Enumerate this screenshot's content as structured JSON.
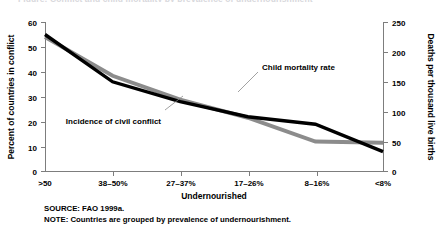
{
  "figure": {
    "cut_title": "Figure: Conflict and child mortality by prevalence of undernourishment",
    "background": "#ffffff"
  },
  "chart_data": {
    "type": "line",
    "title": "",
    "xlabel": "Undernourished",
    "categories": [
      ">50",
      "38–50%",
      "27–37%",
      "17–26%",
      "8–16%",
      "<8%"
    ],
    "grid": false,
    "legend_position": "inline-annotations",
    "axes": {
      "left": {
        "label": "Percent of countries in conflict",
        "ylim": [
          0,
          60
        ],
        "ticks": [
          0,
          10,
          20,
          30,
          40,
          50,
          60
        ],
        "tick_labels": [
          "0",
          "10",
          "20",
          "30",
          "40",
          "50",
          "60"
        ]
      },
      "right": {
        "label": "Deaths per thousand live births",
        "ylim": [
          0,
          250
        ],
        "ticks": [
          0,
          50,
          100,
          150,
          200,
          250
        ],
        "tick_labels": [
          "0",
          "50",
          "100",
          "150",
          "200",
          "250"
        ]
      }
    },
    "series": [
      {
        "name": "Incidence of civil conflict",
        "axis": "left",
        "color": "#000000",
        "values": [
          55,
          36,
          28,
          22,
          19,
          8
        ]
      },
      {
        "name": "Child mortality rate",
        "axis": "right",
        "color": "#8c8c8c",
        "values": [
          225,
          160,
          120,
          90,
          50,
          48
        ]
      }
    ],
    "annotations": [
      {
        "text": "Child mortality rate",
        "series": "Child mortality rate"
      },
      {
        "text": "Incidence of civil conflict",
        "series": "Incidence of civil conflict"
      }
    ]
  },
  "footer": {
    "source": "SOURCE: FAO 1999a.",
    "note": "NOTE: Countries are grouped by prevalence of undernourishment."
  }
}
